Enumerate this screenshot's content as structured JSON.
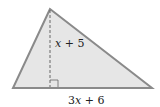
{
  "figure": {
    "shape": "triangle",
    "fill_color": "#e6e6e6",
    "stroke_color": "#8a8a8a",
    "height_label": {
      "var": "x",
      "rest": " + 5"
    },
    "base_label": {
      "coef": "3",
      "var": "x",
      "rest": " + 6"
    }
  }
}
